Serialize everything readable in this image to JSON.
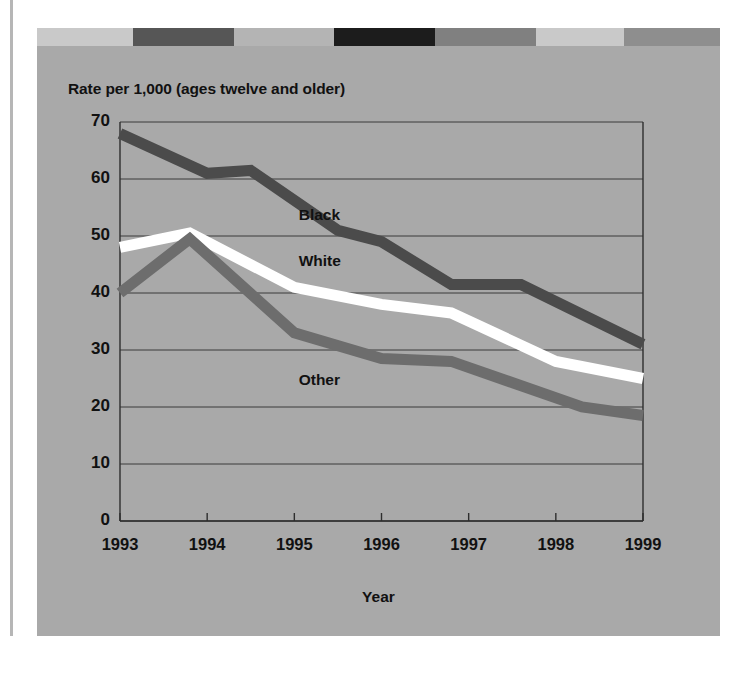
{
  "page": {
    "faint_top_text": "",
    "background_color": "#ffffff",
    "panel_color": "#a9a9a9"
  },
  "decorative_bar": {
    "name": "decorative-top-bar",
    "segments": [
      {
        "color": "#c9c9c9",
        "width": 96
      },
      {
        "color": "#565656",
        "width": 101
      },
      {
        "color": "#b4b4b4",
        "width": 100
      },
      {
        "color": "#1c1c1c",
        "width": 101
      },
      {
        "color": "#808080",
        "width": 101
      },
      {
        "color": "#c9c9c9",
        "width": 88
      },
      {
        "color": "#8e8e8e",
        "width": 96
      }
    ]
  },
  "chart_data": {
    "type": "line",
    "title": "Rate per 1,000 (ages twelve and older)",
    "xlabel": "Year",
    "ylabel": "",
    "x": [
      1993,
      1994,
      1995,
      1996,
      1997,
      1998,
      1999
    ],
    "xtick_labels": [
      "1993",
      "1994",
      "1995",
      "1996",
      "1997",
      "1998",
      "1999"
    ],
    "ytick_labels": [
      "0",
      "10",
      "20",
      "30",
      "40",
      "50",
      "60",
      "70"
    ],
    "ytick_values": [
      0,
      10,
      20,
      30,
      40,
      50,
      60,
      70
    ],
    "ylim": [
      0,
      70
    ],
    "xlim": [
      1993,
      1999
    ],
    "grid": true,
    "legend_position": "inline-labels",
    "series": [
      {
        "name": "Black",
        "color": "#4b4b4b",
        "label_x": 1995.05,
        "label_y": 53.5,
        "x": [
          1993,
          1994,
          1994.5,
          1995.5,
          1996,
          1996.8,
          1997.6,
          1999
        ],
        "values": [
          68,
          61,
          61.5,
          51,
          49,
          41.5,
          41.5,
          31
        ],
        "yearly_values": [
          68,
          61,
          55,
          49,
          41.5,
          38,
          31
        ]
      },
      {
        "name": "White",
        "color": "#ffffff",
        "label_x": 1995.05,
        "label_y": 45.5,
        "x": [
          1993,
          1993.8,
          1995,
          1996,
          1996.8,
          1998,
          1999
        ],
        "values": [
          48,
          50.5,
          41,
          38,
          36.5,
          28,
          25
        ],
        "yearly_values": [
          48,
          49.5,
          41,
          38,
          34,
          28,
          25
        ]
      },
      {
        "name": "Other",
        "color": "#6d6d6d",
        "label_x": 1995.05,
        "label_y": 24.5,
        "x": [
          1993,
          1993.8,
          1995,
          1996,
          1996.8,
          1998.3,
          1999
        ],
        "values": [
          40,
          49.5,
          33,
          28.5,
          28,
          20,
          18.5
        ],
        "yearly_values": [
          40,
          49.5,
          33,
          28.5,
          24,
          20,
          18.5
        ]
      }
    ]
  }
}
